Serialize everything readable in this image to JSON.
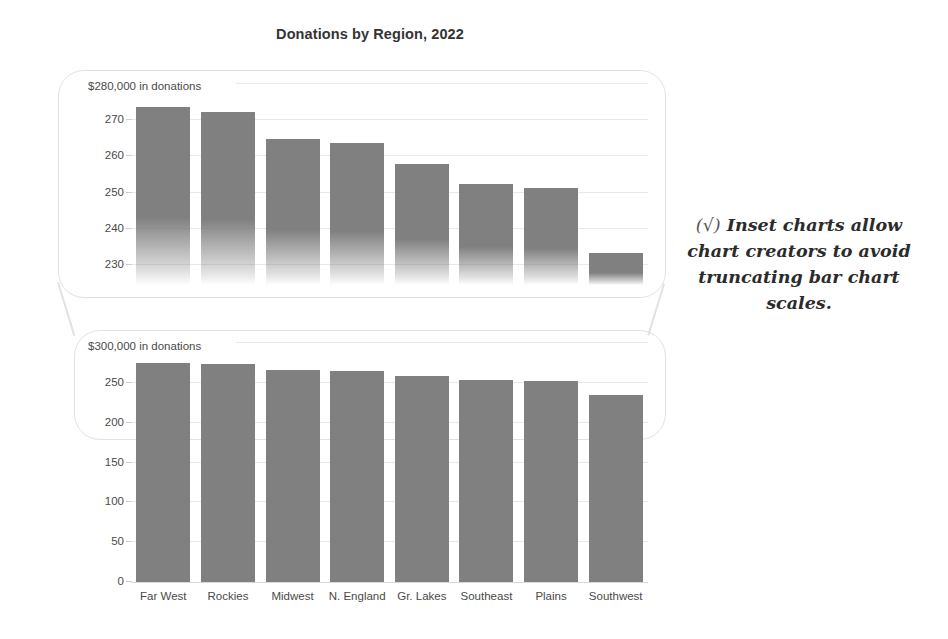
{
  "title": "Donations by Region, 2022",
  "annotation": {
    "marker": "(√)",
    "text": "Inset charts allow chart creators to avoid truncating bar chart scales."
  },
  "top_chart": {
    "axis_note": "$280,000 in donations",
    "yticks": [
      "270",
      "260",
      "250",
      "240",
      "230"
    ]
  },
  "bottom_chart": {
    "axis_note": "$300,000 in donations",
    "yticks": [
      "250",
      "200",
      "150",
      "100",
      "50",
      "0"
    ]
  },
  "chart_data": {
    "type": "bar",
    "title": "Donations by Region, 2022",
    "xlabel": "",
    "ylabel": "thousands of dollars in donations",
    "categories": [
      "Far West",
      "Rockies",
      "Midwest",
      "N. England",
      "Gr. Lakes",
      "Southeast",
      "Plains",
      "Southwest"
    ],
    "values": [
      273.5,
      272,
      264.5,
      263.5,
      257.5,
      252,
      251,
      233
    ],
    "units": "thousands of US dollars",
    "grid": true,
    "legend": "none",
    "panels": [
      {
        "name": "inset-zoom-panel",
        "note": "$280,000 in donations",
        "ylim": [
          225,
          280
        ],
        "yticks": [
          230,
          240,
          250,
          260,
          270,
          280
        ],
        "truncated_axis": true
      },
      {
        "name": "full-scale-panel",
        "note": "$300,000 in donations",
        "ylim": [
          0,
          300
        ],
        "yticks": [
          0,
          50,
          100,
          150,
          200,
          250,
          300
        ],
        "truncated_axis": false
      }
    ],
    "annotations": [
      "(√) Inset charts allow chart creators to avoid truncating bar chart scales."
    ]
  },
  "colors": {
    "bar": "#808080",
    "grid": "#e8e8e8",
    "inset_border": "#e2e2e2",
    "text": "#3a3a3a"
  }
}
